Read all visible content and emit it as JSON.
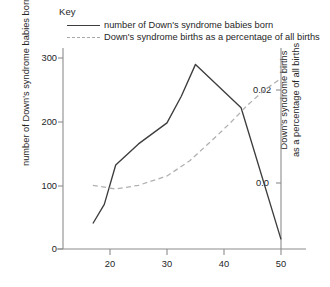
{
  "legend": {
    "title": "Key",
    "entries": [
      {
        "label": "number of Down's syndrome babies born",
        "style": "solid",
        "color": "#3d3d3d"
      },
      {
        "label": "Down's syndrome births as a percentage of all births",
        "style": "dashed",
        "color": "#a8a8a8"
      }
    ]
  },
  "axes": {
    "left_title": "number of Down's syndrome babies born per year",
    "right_title_line1": "Down's syndrome births",
    "right_title_line2": "as a percentage of all births",
    "left_ticks": [
      "0",
      "100",
      "200",
      "300"
    ],
    "right_ticks": [
      "0.0",
      "0.02"
    ],
    "x_ticks": [
      "20",
      "30",
      "40",
      "50"
    ]
  },
  "chart_data": {
    "type": "line",
    "title": "",
    "xlabel": "",
    "ylabel": "number of Down's syndrome babies born per year",
    "y2label": "Down's syndrome births as a percentage of all births",
    "xlim": [
      16.5,
      50.5
    ],
    "ylim": [
      0,
      330
    ],
    "y2lim": [
      -0.0195,
      0.0215
    ],
    "xticks": [
      20,
      30,
      40,
      50
    ],
    "yticks": [
      0,
      100,
      200,
      300
    ],
    "y2ticks": [
      0.0,
      0.02
    ],
    "grid": false,
    "legend_position": "top-left",
    "series": [
      {
        "name": "number of Down's syndrome babies born",
        "axis": "left",
        "style": "solid",
        "color": "#3d3d3d",
        "x": [
          17.0,
          19.0,
          21.0,
          25.0,
          30.0,
          32.5,
          35.0,
          43.0,
          50.0
        ],
        "values": [
          40,
          70,
          132,
          165,
          198,
          240,
          290,
          222,
          15
        ]
      },
      {
        "name": "Down's syndrome births as a percentage of all births",
        "axis": "right",
        "style": "dashed",
        "color": "#a8a8a8",
        "x": [
          17.0,
          21.0,
          25.0,
          30.0,
          34.0,
          38.0,
          41.0,
          44.0,
          47.0,
          50.0
        ],
        "values": [
          -0.0005,
          -0.0013,
          -0.0005,
          0.0015,
          0.0048,
          0.0093,
          0.0128,
          0.0166,
          0.0199,
          0.0225
        ]
      }
    ]
  }
}
